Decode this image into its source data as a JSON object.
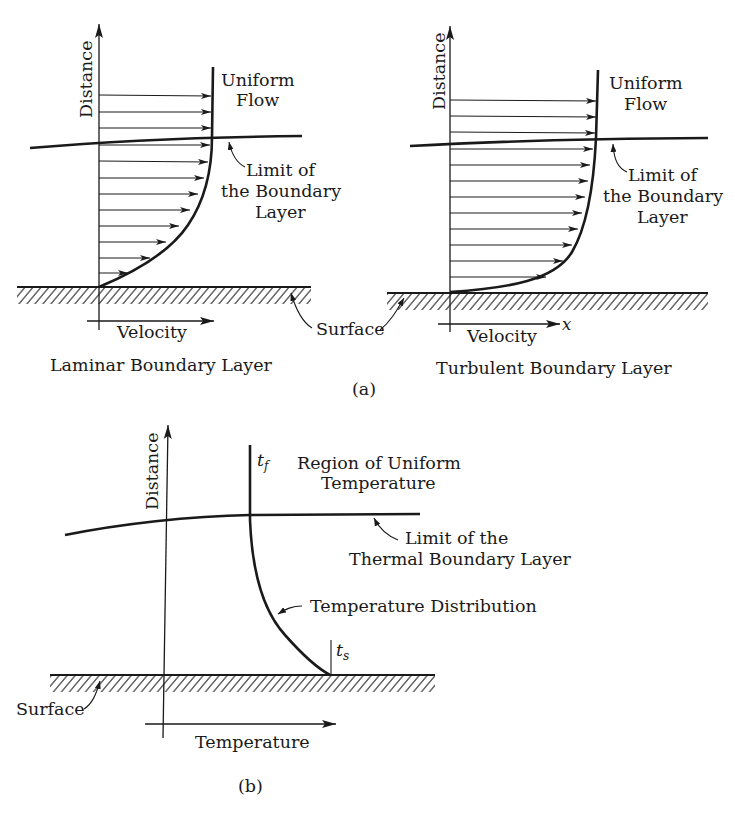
{
  "figure": {
    "part_a": {
      "caption": "(a)",
      "laminar": {
        "title": "Laminar Boundary Layer",
        "y_axis_label": "Distance",
        "x_axis_label": "Velocity",
        "uniform_flow_line1": "Uniform",
        "uniform_flow_line2": "Flow",
        "limit_line1": "Limit of",
        "limit_line2": "the Boundary",
        "limit_line3": "Layer"
      },
      "turbulent": {
        "title": "Turbulent Boundary Layer",
        "y_axis_label": "Distance",
        "x_axis_label": "Velocity",
        "x_symbol": "x",
        "uniform_flow_line1": "Uniform",
        "uniform_flow_line2": "Flow",
        "limit_line1": "Limit of",
        "limit_line2": "the Boundary",
        "limit_line3": "Layer"
      },
      "surface_label": "Surface"
    },
    "part_b": {
      "caption": "(b)",
      "y_axis_label": "Distance",
      "x_axis_label": "Temperature",
      "t_f_symbol": "t",
      "t_f_sub": "f",
      "t_s_symbol": "t",
      "t_s_sub": "s",
      "region_line1": "Region of Uniform",
      "region_line2": "Temperature",
      "limit_line1": "Limit of the",
      "limit_line2": "Thermal Boundary Layer",
      "distribution_label": "Temperature Distribution",
      "surface_label": "Surface"
    },
    "colors": {
      "ink": "#1a1a1a",
      "background": "#ffffff"
    }
  }
}
